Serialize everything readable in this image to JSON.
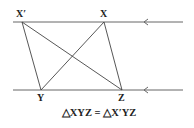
{
  "diagram": {
    "colors": {
      "line": "#555555",
      "text": "#222222",
      "background": "#ffffff"
    },
    "parallel_lines": [
      {
        "name": "top-line",
        "x1": 13,
        "x2": 183,
        "y": 22,
        "arrow_x": 145
      },
      {
        "name": "bottom-line",
        "x1": 13,
        "x2": 183,
        "y": 90,
        "arrow_x": 145
      }
    ],
    "points": {
      "X_prime": {
        "label": "X′",
        "x": 22,
        "y": 22
      },
      "X": {
        "label": "X",
        "x": 104,
        "y": 22
      },
      "Y": {
        "label": "Y",
        "x": 41,
        "y": 90
      },
      "Z": {
        "label": "Z",
        "x": 122,
        "y": 90
      }
    },
    "segments": [
      "X′Y",
      "X′Z",
      "XY",
      "XZ"
    ],
    "caption": "△XYZ = △X′YZ"
  }
}
